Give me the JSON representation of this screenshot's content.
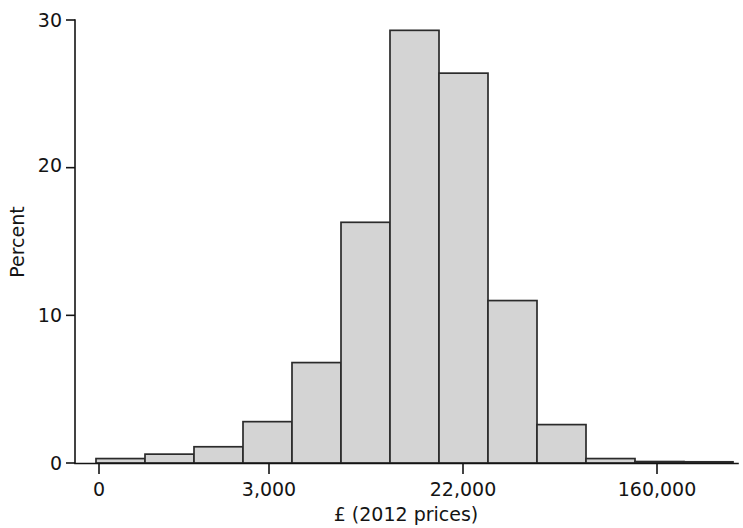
{
  "chart_data": {
    "type": "bar",
    "title": "",
    "subtitle": "",
    "xlabel": "£ (2012 prices)",
    "ylabel": "Percent",
    "grid": false,
    "legend": false,
    "legend_position": "none",
    "note": "Histogram of income distribution on a logarithmic pound scale; bars are contiguous (no gaps).",
    "bar_style": {
      "fill": "#d4d4d4",
      "stroke": "#2b2b2b"
    },
    "x_axis": {
      "scale": "log-like",
      "tick_labels": [
        "0",
        "3,000",
        "22,000",
        "160,000"
      ],
      "tick_pixel_positions": [
        99,
        269,
        463,
        657
      ],
      "axis_pixel_range": [
        75,
        737
      ]
    },
    "y_axis": {
      "tick_labels": [
        "0",
        "10",
        "20",
        "30"
      ],
      "tick_values": [
        0,
        10,
        20,
        30
      ],
      "ylim": [
        0,
        30
      ],
      "axis_pixel_range": [
        463,
        20
      ]
    },
    "categories": [
      "bin-1",
      "bin-2",
      "bin-3",
      "bin-4",
      "bin-5",
      "bin-6",
      "bin-7",
      "bin-8",
      "bin-9",
      "bin-10",
      "bin-11",
      "bin-12",
      "bin-13"
    ],
    "values": [
      0.3,
      0.6,
      1.1,
      2.8,
      6.8,
      16.3,
      29.3,
      26.4,
      11.0,
      2.6,
      0.3,
      0.1,
      0.05
    ],
    "bar_pixel_lefts": [
      96,
      145,
      194,
      243,
      292,
      341,
      390,
      439,
      488,
      537,
      586,
      635,
      684
    ],
    "bar_pixel_width": 49
  },
  "axis": {
    "y_label": "Percent",
    "x_label": "£ (2012 prices)",
    "y_ticks": [
      "0",
      "10",
      "20",
      "30"
    ],
    "x_ticks": [
      "0",
      "3,000",
      "22,000",
      "160,000"
    ]
  }
}
